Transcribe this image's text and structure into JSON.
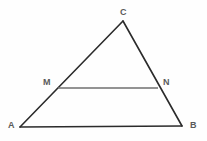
{
  "figure": {
    "canvas": {
      "width": 207,
      "height": 141
    },
    "background_color": "#fefefe",
    "stroke_color_triangle": "#2b2b2b",
    "stroke_color_midsegment": "#6f6f6f",
    "label_color": "#5a5a5a",
    "stroke_width_triangle": 1.6,
    "stroke_width_midsegment": 1.6
  },
  "points": {
    "A": {
      "label": "A",
      "x": 20,
      "y": 127,
      "label_x": 8,
      "label_y": 121
    },
    "B": {
      "label": "B",
      "x": 182,
      "y": 126,
      "label_x": 190,
      "label_y": 121
    },
    "C": {
      "label": "C",
      "x": 123,
      "y": 21,
      "label_x": 120,
      "label_y": 8
    },
    "M": {
      "label": "M",
      "x": 58,
      "y": 88,
      "label_x": 43,
      "label_y": 78
    },
    "N": {
      "label": "N",
      "x": 158,
      "y": 88,
      "label_x": 163,
      "label_y": 78
    }
  },
  "segments": [
    {
      "name": "side-AC",
      "from": "A",
      "to": "C",
      "style": "triangle"
    },
    {
      "name": "side-CB",
      "from": "C",
      "to": "B",
      "style": "triangle"
    },
    {
      "name": "side-AB",
      "from": "A",
      "to": "B",
      "style": "triangle"
    },
    {
      "name": "midsegment-MN",
      "from": "M",
      "to": "N",
      "style": "midsegment"
    }
  ],
  "chart_data": {
    "type": "diagram",
    "shape": "triangle",
    "vertices": [
      {
        "name": "A",
        "x": 20,
        "y": 127
      },
      {
        "name": "B",
        "x": 182,
        "y": 126
      },
      {
        "name": "C",
        "x": 123,
        "y": 21
      }
    ],
    "interior_points": [
      {
        "name": "M",
        "x": 58,
        "y": 88,
        "on_segment": "AC"
      },
      {
        "name": "N",
        "x": 158,
        "y": 88,
        "on_segment": "CB"
      }
    ],
    "edges": [
      {
        "from": "A",
        "to": "C"
      },
      {
        "from": "C",
        "to": "B"
      },
      {
        "from": "A",
        "to": "B"
      },
      {
        "from": "M",
        "to": "N"
      }
    ],
    "labels": [
      "A",
      "B",
      "C",
      "M",
      "N"
    ]
  }
}
